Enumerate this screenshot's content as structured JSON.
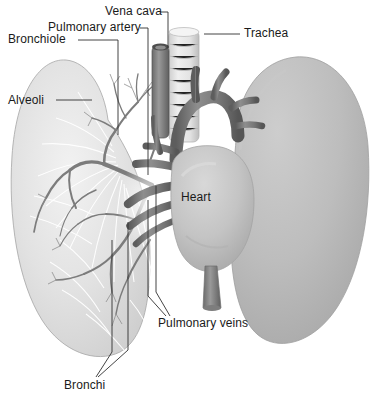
{
  "figure": {
    "style": "grayscale medical illustration",
    "width": 384,
    "height": 394,
    "background_color": "#ffffff"
  },
  "labels": [
    {
      "id": "bronchiole",
      "text": "Bronchiole",
      "x": 8,
      "y": 33
    },
    {
      "id": "pulmonary-artery",
      "text": "Pulmonary artery",
      "x": 48,
      "y": 21
    },
    {
      "id": "vena-cava",
      "text": "Vena cava",
      "x": 105,
      "y": 5
    },
    {
      "id": "trachea",
      "text": "Trachea",
      "x": 244,
      "y": 27
    },
    {
      "id": "alveoli",
      "text": "Alveoli",
      "x": 8,
      "y": 94
    },
    {
      "id": "heart",
      "text": "Heart",
      "x": 181,
      "y": 191
    },
    {
      "id": "pulmonary-veins",
      "text": "Pulmonary veins",
      "x": 158,
      "y": 317
    },
    {
      "id": "bronchi",
      "text": "Bronchi",
      "x": 64,
      "y": 379
    }
  ],
  "colors": {
    "text": "#1a1a1a",
    "leader_line": "#3a3a3a",
    "lung_fill_light": "#dcdcdc",
    "lung_fill_right": "#b9b9b9",
    "lung_edge": "#9a9a9a",
    "vessel_dark": "#6e6e6e",
    "vessel_mid": "#8a8a8a",
    "trachea_light": "#e4e4e4",
    "heart_fill": "#c6c6c6",
    "bronchial_tree": "#7d7d7d",
    "alveoli_white": "#fbfbfb",
    "background": "#ffffff"
  },
  "structures": [
    {
      "name": "left-lung",
      "description": "translucent left lung showing internal bronchial tree and alveoli"
    },
    {
      "name": "right-lung",
      "description": "solid opaque gray right lung, rounded ovoid"
    },
    {
      "name": "trachea",
      "description": "ribbed pale cylinder descending from top center"
    },
    {
      "name": "heart",
      "description": "central gray heart mass with great vessels"
    },
    {
      "name": "aortic-arch",
      "description": "dark arched vessel over the heart with branch vessels"
    },
    {
      "name": "vena-cava",
      "description": "vertical dark tube left of trachea, open lumen at top"
    },
    {
      "name": "pulmonary-artery",
      "description": "dark vessel branching into the left lung"
    },
    {
      "name": "pulmonary-veins",
      "description": "vessels entering the heart from the lung hilum"
    },
    {
      "name": "bronchi",
      "description": "main airway branches entering the left lung"
    },
    {
      "name": "bronchiole",
      "description": "small airway branch within the bronchial tree"
    },
    {
      "name": "descending-aorta",
      "description": "vessel stub below the heart"
    }
  ]
}
